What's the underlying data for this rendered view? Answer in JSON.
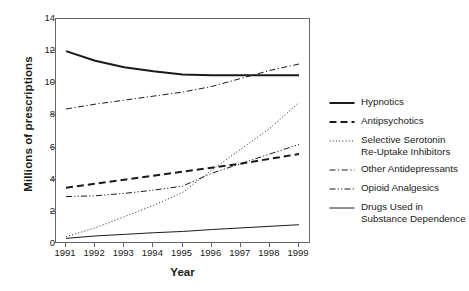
{
  "chart_data": {
    "type": "line",
    "title": "",
    "xlabel": "Year",
    "ylabel": "Millions of prescriptions",
    "x": [
      1991,
      1992,
      1993,
      1994,
      1995,
      1996,
      1997,
      1998,
      1999
    ],
    "xticks": [
      "1991",
      "1992",
      "1993",
      "1994",
      "1995",
      "1996",
      "1997",
      "1998",
      "1999"
    ],
    "yticks": [
      "0",
      "2",
      "4",
      "6",
      "8",
      "10",
      "12",
      "14"
    ],
    "xlim": [
      1991,
      1999
    ],
    "ylim": [
      0,
      14
    ],
    "grid": false,
    "legend_position": "right",
    "series": [
      {
        "name": "Hypnotics",
        "style": "solid-thick",
        "values": [
          12.0,
          11.4,
          11.0,
          10.75,
          10.55,
          10.5,
          10.5,
          10.5,
          10.5
        ]
      },
      {
        "name": "Antipsychotics",
        "style": "dashed-thick",
        "values": [
          3.5,
          3.75,
          4.0,
          4.25,
          4.5,
          4.75,
          5.0,
          5.3,
          5.6
        ]
      },
      {
        "name": "Selective Serotonin\nRe-Uptake Inhibitors",
        "style": "dotted",
        "values": [
          0.45,
          1.0,
          1.7,
          2.4,
          3.2,
          4.6,
          5.9,
          7.2,
          8.8
        ]
      },
      {
        "name": "Other Antidepressants",
        "style": "dash-dot",
        "values": [
          8.4,
          8.7,
          8.95,
          9.2,
          9.45,
          9.8,
          10.3,
          10.8,
          11.2
        ]
      },
      {
        "name": "Opioid Analgesics",
        "style": "dash-dot-dot",
        "values": [
          2.95,
          3.0,
          3.15,
          3.35,
          3.6,
          4.4,
          5.0,
          5.6,
          6.2
        ]
      },
      {
        "name": "Drugs Used in\nSubstance Dependence",
        "style": "solid-thin",
        "values": [
          0.35,
          0.5,
          0.6,
          0.7,
          0.78,
          0.9,
          1.0,
          1.1,
          1.2
        ]
      }
    ]
  },
  "legend": {
    "items": [
      {
        "label": "Hypnotics",
        "style": "solid-thick"
      },
      {
        "label": "Antipsychotics",
        "style": "dashed-thick"
      },
      {
        "label": "Selective Serotonin\nRe-Uptake Inhibitors",
        "style": "dotted"
      },
      {
        "label": "Other Antidepressants",
        "style": "dash-dot"
      },
      {
        "label": "Opioid Analgesics",
        "style": "dash-dot-dot"
      },
      {
        "label": "Drugs Used in\nSubstance Dependence",
        "style": "solid-thin"
      }
    ]
  },
  "colors": {
    "line": "#1a1a1a",
    "axis": "#666666",
    "background": "#ffffff"
  }
}
